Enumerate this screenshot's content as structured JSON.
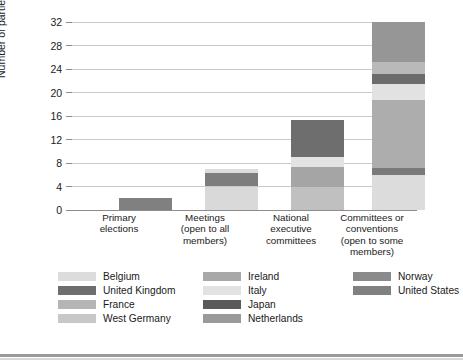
{
  "chart_data": {
    "type": "bar",
    "subtype": "stacked-bar",
    "title": "",
    "xlabel": "",
    "ylabel": "Number of parties",
    "ylim": [
      0,
      32
    ],
    "ytick_values": [
      0,
      4,
      8,
      12,
      16,
      20,
      24,
      28,
      32
    ],
    "ytick_labels": [
      "0",
      "4",
      "8",
      "12",
      "16",
      "20",
      "24",
      "28",
      "32"
    ],
    "grid": "horizontal",
    "legend_position": "bottom",
    "categories": [
      "Primary elections",
      "Meetings (open to all members)",
      "National executive committees",
      "Committees or conventions (open to some members)"
    ],
    "category_lines": [
      [
        "Primary",
        "elections"
      ],
      [
        "Meetings",
        "(open to all",
        "members)"
      ],
      [
        "National",
        "executive",
        "committees"
      ],
      [
        "Committees or",
        "conventions",
        "(open to some",
        "members)"
      ]
    ],
    "series": [
      {
        "name": "Belgium",
        "color": "#dcdcdc",
        "values": [
          0,
          4,
          0,
          6
        ]
      },
      {
        "name": "United Kingdom",
        "color": "#6e6e6e",
        "values": [
          0,
          0,
          0,
          1
        ]
      },
      {
        "name": "France",
        "color": "#b5b5b5",
        "values": [
          0,
          0,
          4,
          0
        ]
      },
      {
        "name": "West Germany",
        "color": "#c8c8c8",
        "values": [
          0,
          0,
          0,
          11
        ]
      },
      {
        "name": "Ireland",
        "color": "#a8a8a8",
        "values": [
          0,
          0,
          5,
          0
        ]
      },
      {
        "name": "Italy",
        "color": "#e2e2e2",
        "values": [
          0,
          0.7,
          0,
          2
        ]
      },
      {
        "name": "Japan",
        "color": "#5a5a5a",
        "values": [
          0,
          0,
          0,
          1.5
        ]
      },
      {
        "name": "Netherlands",
        "color": "#9a9a9a",
        "values": [
          0,
          0,
          0,
          2
        ]
      },
      {
        "name": "Norway",
        "color": "#8a8a8a",
        "values": [
          0,
          2.3,
          0,
          8.5
        ]
      },
      {
        "name": "United States",
        "color": "#808080",
        "values": [
          2,
          0,
          6.3,
          0
        ]
      }
    ],
    "totals": [
      2,
      7,
      15.3,
      32
    ],
    "stack_order_bottom_to_top": [
      [
        "United States"
      ],
      [
        "Belgium",
        "Norway",
        "Italy"
      ],
      [
        "France",
        "Ireland",
        "Italy",
        "United States"
      ],
      [
        "Belgium",
        "United Kingdom",
        "Norway",
        "West Germany",
        "Italy",
        "Japan",
        "Netherlands"
      ]
    ]
  },
  "axis": {
    "y_title": "Number of parties"
  },
  "legend": {
    "columns": [
      {
        "entries": [
          {
            "label": "Belgium",
            "color": "#dcdcdc"
          },
          {
            "label": "United Kingdom",
            "color": "#6e6e6e"
          },
          {
            "label": "France",
            "color": "#b5b5b5"
          },
          {
            "label": "West Germany",
            "color": "#c8c8c8"
          }
        ]
      },
      {
        "entries": [
          {
            "label": "Ireland",
            "color": "#a8a8a8"
          },
          {
            "label": "Italy",
            "color": "#e2e2e2"
          },
          {
            "label": "Japan",
            "color": "#5a5a5a"
          },
          {
            "label": "Netherlands",
            "color": "#9a9a9a"
          }
        ]
      },
      {
        "entries": [
          {
            "label": "Norway",
            "color": "#8a8a8a"
          },
          {
            "label": "United States",
            "color": "#808080"
          }
        ]
      }
    ]
  },
  "render": {
    "plot": {
      "left": 72,
      "top": 22,
      "width": 345,
      "height": 188
    },
    "bar_width": 53,
    "bar_centers": [
      47,
      133,
      219,
      300
    ],
    "legend_col_lefts": [
      0,
      145,
      295
    ],
    "cat_label_lefts": [
      -5,
      81,
      167,
      248
    ]
  },
  "bars": [
    {
      "name": "Primary elections",
      "total": 2,
      "segments": [
        {
          "series": "United States",
          "color": "#808080",
          "from": 0,
          "to": 2
        }
      ]
    },
    {
      "name": "Meetings (open to all members)",
      "total": 7,
      "segments": [
        {
          "series": "Belgium",
          "color": "#d9d9d9",
          "from": 0,
          "to": 4.0
        },
        {
          "series": "Norway",
          "color": "#7d7d7d",
          "from": 4.0,
          "to": 6.3
        },
        {
          "series": "Italy",
          "color": "#dcdcdc",
          "from": 6.3,
          "to": 7.0
        }
      ]
    },
    {
      "name": "National executive committees",
      "total": 15.3,
      "segments": [
        {
          "series": "France",
          "color": "#c0c0c0",
          "from": 0,
          "to": 4.0
        },
        {
          "series": "Ireland",
          "color": "#a5a5a5",
          "from": 4.0,
          "to": 7.3
        },
        {
          "series": "Italy",
          "color": "#e3e3e3",
          "from": 7.3,
          "to": 9.0
        },
        {
          "series": "United States",
          "color": "#6e6e6e",
          "from": 9.0,
          "to": 15.3
        }
      ]
    },
    {
      "name": "Committees or conventions (open to some members)",
      "total": 32,
      "segments": [
        {
          "series": "Belgium",
          "color": "#dcdcdc",
          "from": 0,
          "to": 6.0
        },
        {
          "series": "United Kingdom",
          "color": "#7a7a7a",
          "from": 6.0,
          "to": 7.2
        },
        {
          "series": "Norway",
          "color": "#adadad",
          "from": 7.2,
          "to": 18.8
        },
        {
          "series": "West Germany",
          "color": "#e2e2e2",
          "from": 18.8,
          "to": 21.5
        },
        {
          "series": "Japan",
          "color": "#6c6c6c",
          "from": 21.5,
          "to": 23.2
        },
        {
          "series": "Netherlands",
          "color": "#b9b9b9",
          "from": 23.2,
          "to": 25.2
        },
        {
          "series": "Italy",
          "color": "#969696",
          "from": 25.2,
          "to": 32.0
        }
      ]
    }
  ]
}
